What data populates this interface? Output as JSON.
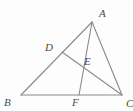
{
  "figure": {
    "type": "geometry-diagram",
    "width": 133,
    "height": 111,
    "background_color": "#fdfdfd",
    "stroke_color": "#8a8a8a",
    "stroke_width": 1.1,
    "label_color": "#4a4a4a"
  },
  "points": {
    "A": {
      "label": "A",
      "x": 92,
      "y": 22,
      "label_x": 99,
      "label_y": 8
    },
    "B": {
      "label": "B",
      "x": 21,
      "y": 95,
      "label_x": 4,
      "label_y": 97
    },
    "C": {
      "label": "C",
      "x": 122,
      "y": 95,
      "label_x": 126,
      "label_y": 98
    },
    "D": {
      "label": "D",
      "x": 62,
      "y": 52,
      "label_x": 45,
      "label_y": 42
    },
    "E": {
      "label": "E",
      "x": 78,
      "y": 64,
      "label_x": 84,
      "label_y": 56
    },
    "F": {
      "label": "F",
      "x": 79,
      "y": 95,
      "label_x": 72,
      "label_y": 97
    }
  },
  "segments": [
    {
      "name": "side-AB",
      "from": "A",
      "to": "B",
      "path": "M 92 22 L 21 95"
    },
    {
      "name": "side-BC",
      "from": "B",
      "to": "C",
      "path": "M 21 95 L 122 95"
    },
    {
      "name": "side-CA",
      "from": "C",
      "to": "A",
      "path": "M 122 95 L 92 22"
    },
    {
      "name": "cevian-AF",
      "from": "A",
      "to": "F",
      "path": "M 92 22 L 79 95"
    },
    {
      "name": "cevian-DC",
      "from": "D",
      "to": "C",
      "path": "M 62 52 L 122 95"
    }
  ]
}
